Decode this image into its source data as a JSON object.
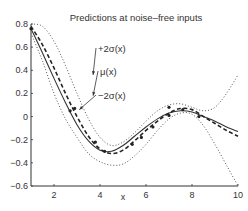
{
  "chart_data": {
    "type": "line",
    "title": "Predictions at noise–free inputs",
    "xlabel": "x",
    "ylabel": "",
    "xlim": [
      1,
      10
    ],
    "ylim": [
      -0.6,
      0.8
    ],
    "xticks": [
      2,
      4,
      6,
      8,
      10
    ],
    "yticks": [
      0.8,
      0.6,
      0.4,
      0.2,
      0,
      -0.2,
      -0.4,
      -0.6
    ],
    "grid": false,
    "legend": "none",
    "x": [
      1,
      1.5,
      2,
      2.5,
      3,
      3.5,
      4,
      4.5,
      5,
      5.5,
      6,
      6.5,
      7,
      7.5,
      8,
      8.5,
      9,
      9.5,
      10
    ],
    "series": [
      {
        "name": "true function",
        "style": "solid",
        "values": [
          0.76,
          0.55,
          0.33,
          0.12,
          -0.07,
          -0.21,
          -0.29,
          -0.3,
          -0.25,
          -0.17,
          -0.09,
          -0.02,
          0.03,
          0.05,
          0.04,
          0.0,
          -0.04,
          -0.09,
          -0.13
        ]
      },
      {
        "name": "μ(x)",
        "style": "dashed",
        "values": [
          0.78,
          0.62,
          0.42,
          0.2,
          0.0,
          -0.17,
          -0.28,
          -0.32,
          -0.29,
          -0.21,
          -0.12,
          -0.04,
          0.03,
          0.07,
          0.06,
          0.0,
          -0.06,
          -0.12,
          -0.17
        ]
      },
      {
        "name": "+2σ(x)",
        "style": "dotted",
        "values": [
          0.8,
          0.78,
          0.65,
          0.44,
          0.2,
          -0.02,
          -0.18,
          -0.25,
          -0.22,
          -0.14,
          -0.04,
          0.05,
          0.1,
          0.11,
          0.08,
          0.05,
          0.08,
          0.2,
          0.36
        ]
      },
      {
        "name": "−2σ(x)",
        "style": "dotted",
        "values": [
          0.72,
          0.48,
          0.2,
          -0.02,
          -0.18,
          -0.32,
          -0.39,
          -0.42,
          -0.41,
          -0.34,
          -0.24,
          -0.12,
          -0.02,
          0.03,
          0.02,
          -0.08,
          -0.24,
          -0.42,
          -0.6
        ]
      }
    ],
    "data_points": [
      [
        1,
        0.76
      ],
      [
        2.7,
        0.05
      ],
      [
        2.9,
        0.07
      ],
      [
        3.8,
        -0.22
      ],
      [
        4.2,
        -0.3
      ],
      [
        5.4,
        -0.24
      ],
      [
        5.8,
        -0.18
      ],
      [
        6.3,
        -0.09
      ],
      [
        7.0,
        0.01
      ],
      [
        7.0,
        0.08
      ],
      [
        7.6,
        0.06
      ],
      [
        8.3,
        0.0
      ]
    ],
    "annotations": [
      {
        "text": "+2σ(x)",
        "target": [
          3.7,
          0.36
        ]
      },
      {
        "text": "μ(x)",
        "target": [
          3.7,
          0.18
        ]
      },
      {
        "text": "−2σ(x)",
        "target": [
          3.1,
          0.06
        ]
      }
    ]
  }
}
